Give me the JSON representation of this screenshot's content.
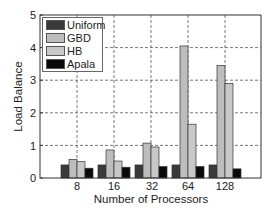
{
  "chart_data": {
    "type": "bar",
    "title": "",
    "xlabel": "Number of Processors",
    "ylabel": "Load Balance",
    "categories": [
      "8",
      "16",
      "32",
      "64",
      "128"
    ],
    "series": [
      {
        "name": "Uniform",
        "color": "#3a3a3a",
        "values": [
          0.4,
          0.4,
          0.4,
          0.4,
          0.4
        ]
      },
      {
        "name": "GBD",
        "color": "#bdbdbd",
        "values": [
          0.57,
          0.86,
          1.07,
          4.05,
          3.45
        ]
      },
      {
        "name": "HB",
        "color": "#c8c8c8",
        "values": [
          0.5,
          0.52,
          0.95,
          1.65,
          2.9
        ]
      },
      {
        "name": "Apala",
        "color": "#0a0a0a",
        "values": [
          0.3,
          0.33,
          0.35,
          0.35,
          0.28
        ]
      }
    ],
    "ylim": [
      0,
      5
    ],
    "yticks": [
      "0",
      "1",
      "2",
      "3",
      "4",
      "5"
    ],
    "grid": true,
    "grid_style": "dashed",
    "legend_position": "upper left"
  }
}
